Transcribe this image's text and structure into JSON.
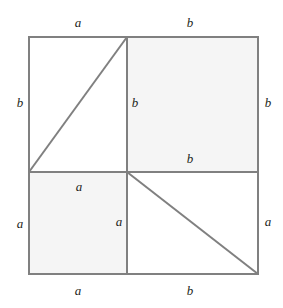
{
  "figure": {
    "name": "pythagorean-dissection-square",
    "type": "geometric-diagram",
    "canvas": {
      "width": 283,
      "height": 308
    },
    "colors": {
      "background": "#ffffff",
      "stroke": "#808080",
      "shade": "#f5f5f5",
      "text": "#231f20"
    },
    "square": {
      "x": 29,
      "y": 37,
      "width": 229,
      "height": 237
    },
    "divider_x": 127,
    "divider_y": 172,
    "regions": [
      {
        "name": "top-left-square",
        "x": 29,
        "y": 37,
        "width": 98,
        "height": 135,
        "fill": "#ffffff"
      },
      {
        "name": "top-right-square",
        "x": 127,
        "y": 37,
        "width": 131,
        "height": 135,
        "fill": "#f5f5f5"
      },
      {
        "name": "bottom-left-square",
        "x": 29,
        "y": 172,
        "width": 98,
        "height": 102,
        "fill": "#f5f5f5"
      },
      {
        "name": "bottom-right-square",
        "x": 127,
        "y": 172,
        "width": 131,
        "height": 102,
        "fill": "#ffffff"
      }
    ],
    "diagonals": [
      {
        "name": "upper-left-diagonal",
        "x1": 29,
        "y1": 172,
        "x2": 127,
        "y2": 37
      },
      {
        "name": "lower-right-diagonal",
        "x1": 127,
        "y1": 172,
        "x2": 258,
        "y2": 274
      }
    ],
    "labels": [
      {
        "id": "top-a",
        "text": "a",
        "x": 78,
        "y": 22
      },
      {
        "id": "top-b",
        "text": "b",
        "x": 190,
        "y": 22
      },
      {
        "id": "left-b",
        "text": "b",
        "x": 20,
        "y": 102
      },
      {
        "id": "inner-b",
        "text": "b",
        "x": 135,
        "y": 102
      },
      {
        "id": "right-b",
        "text": "b",
        "x": 268,
        "y": 102
      },
      {
        "id": "middle-b",
        "text": "b",
        "x": 190,
        "y": 158
      },
      {
        "id": "inner-a-top",
        "text": "a",
        "x": 79,
        "y": 186
      },
      {
        "id": "left-a",
        "text": "a",
        "x": 20,
        "y": 223
      },
      {
        "id": "inner-a-mid",
        "text": "a",
        "x": 119,
        "y": 221
      },
      {
        "id": "right-a",
        "text": "a",
        "x": 268,
        "y": 221
      },
      {
        "id": "bottom-a",
        "text": "a",
        "x": 78,
        "y": 290
      },
      {
        "id": "bottom-b",
        "text": "b",
        "x": 190,
        "y": 290
      }
    ]
  }
}
